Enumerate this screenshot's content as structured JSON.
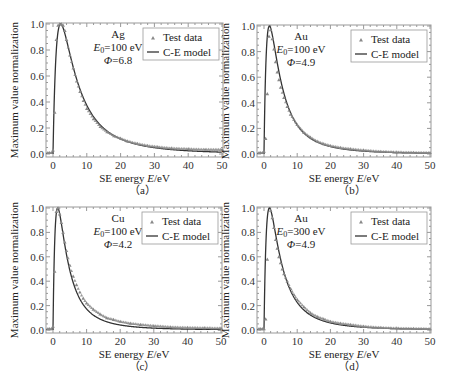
{
  "figure": {
    "width": 453,
    "height": 388,
    "colors": {
      "frame": "#999999",
      "curve": "#333333",
      "marker": "#888888",
      "text": "#222222"
    }
  },
  "chart_data": [
    {
      "id": "a",
      "type": "scatter",
      "caption": "（a）",
      "xlabel": "SE energy E/eV",
      "ylabel": "Maximum value normalization",
      "xlim": [
        -2,
        50
      ],
      "ylim": [
        0,
        1.0
      ],
      "xticks": [
        0,
        10,
        20,
        30,
        40,
        50
      ],
      "yticks": [
        "0.0",
        "0.2",
        "0.4",
        "0.6",
        "0.8",
        "1.0"
      ],
      "annotation": {
        "material": "Ag",
        "E0": "E0=100 eV",
        "phi": "Φ=6.8"
      },
      "legend": [
        "Test data",
        "C-E model"
      ],
      "model": {
        "phi": 6.8,
        "peak_E": 2.2,
        "tail": 0.035
      },
      "series": [
        {
          "name": "Test data",
          "x": [
            -1.5,
            -1,
            -0.5,
            0,
            0.5,
            1,
            1.5,
            2,
            2.5,
            3,
            3.5,
            4,
            5,
            6,
            7,
            8,
            9,
            10,
            12,
            14,
            16,
            18,
            20,
            22,
            25,
            28,
            31,
            35,
            40,
            45,
            50
          ],
          "y": [
            0.01,
            0.01,
            0.01,
            0.03,
            0.32,
            0.88,
            0.99,
            1.0,
            1.0,
            0.99,
            0.95,
            0.88,
            0.76,
            0.66,
            0.56,
            0.48,
            0.41,
            0.35,
            0.27,
            0.21,
            0.17,
            0.14,
            0.12,
            0.1,
            0.08,
            0.065,
            0.055,
            0.045,
            0.04,
            0.035,
            0.035
          ]
        },
        {
          "name": "C-E model",
          "type": "line"
        }
      ]
    },
    {
      "id": "b",
      "type": "scatter",
      "caption": "（b）",
      "xlabel": "SE energy E/eV",
      "ylabel": "Maximum value normalization",
      "xlim": [
        -2,
        50
      ],
      "ylim": [
        0,
        1.0
      ],
      "xticks": [
        0,
        10,
        20,
        30,
        40,
        50
      ],
      "yticks": [
        "0.0",
        "0.2",
        "0.4",
        "0.6",
        "0.8",
        "1.0"
      ],
      "annotation": {
        "material": "Au",
        "E0": "E0=100 eV",
        "phi": "Φ=4.9"
      },
      "legend": [
        "Test data",
        "C-E model"
      ],
      "model": {
        "phi": 4.9,
        "peak_E": 1.6,
        "tail": 0.01
      },
      "series": [
        {
          "name": "Test data",
          "x": [
            -1.5,
            -1,
            -0.5,
            0,
            0.5,
            1,
            1.5,
            2,
            2.5,
            3,
            3.5,
            4,
            4.5,
            5,
            6,
            7,
            8,
            9,
            10,
            12,
            14,
            16,
            18,
            20,
            23,
            26,
            30,
            35,
            40,
            45,
            50
          ],
          "y": [
            0.01,
            0.01,
            0.01,
            0.02,
            0.12,
            0.47,
            0.92,
            0.97,
            0.9,
            0.82,
            0.72,
            0.64,
            0.58,
            0.52,
            0.44,
            0.37,
            0.31,
            0.27,
            0.23,
            0.17,
            0.13,
            0.1,
            0.08,
            0.065,
            0.05,
            0.04,
            0.03,
            0.02,
            0.015,
            0.012,
            0.01
          ]
        },
        {
          "name": "C-E model",
          "type": "line"
        }
      ]
    },
    {
      "id": "c",
      "type": "scatter",
      "caption": "（c）",
      "xlabel": "SE energy E/eV",
      "ylabel": "Maximum value normalization",
      "xlim": [
        -2,
        50
      ],
      "ylim": [
        0,
        1.0
      ],
      "xticks": [
        0,
        10,
        20,
        30,
        40,
        50
      ],
      "yticks": [
        "0.0",
        "0.2",
        "0.4",
        "0.6",
        "0.8",
        "1.0"
      ],
      "annotation": {
        "material": "Cu",
        "E0": "E0=100 eV",
        "phi": "Φ=4.2"
      },
      "legend": [
        "Test data",
        "C-E model"
      ],
      "model": {
        "phi": 4.2,
        "peak_E": 1.4,
        "tail": 0.01
      },
      "series": [
        {
          "name": "Test data",
          "x": [
            -1.5,
            -1,
            -0.5,
            0,
            0.5,
            1,
            1.5,
            2,
            2.5,
            3,
            3.5,
            4,
            5,
            6,
            7,
            8,
            9,
            10,
            12,
            14,
            16,
            18,
            20,
            23,
            26,
            30,
            35,
            40,
            45,
            50
          ],
          "y": [
            0.01,
            0.01,
            0.01,
            0.03,
            0.48,
            0.97,
            1.0,
            0.95,
            0.88,
            0.8,
            0.72,
            0.65,
            0.53,
            0.44,
            0.37,
            0.31,
            0.26,
            0.22,
            0.17,
            0.13,
            0.1,
            0.085,
            0.07,
            0.055,
            0.045,
            0.035,
            0.025,
            0.02,
            0.018,
            0.015
          ]
        },
        {
          "name": "C-E model",
          "type": "line"
        }
      ]
    },
    {
      "id": "d",
      "type": "scatter",
      "caption": "（d）",
      "xlabel": "SE energy E/eV",
      "ylabel": "Maximum value normalization",
      "xlim": [
        -2,
        50
      ],
      "ylim": [
        0,
        1.0
      ],
      "xticks": [
        0,
        10,
        20,
        30,
        40,
        50
      ],
      "yticks": [
        "0.0",
        "0.2",
        "0.4",
        "0.6",
        "0.8",
        "1.0"
      ],
      "annotation": {
        "material": "Au",
        "E0": "E0=300 eV",
        "phi": "Φ=4.9"
      },
      "legend": [
        "Test data",
        "C-E model"
      ],
      "model": {
        "phi": 4.9,
        "peak_E": 1.6,
        "tail": 0.01
      },
      "series": [
        {
          "name": "Test data",
          "x": [
            -1.5,
            -1,
            -0.5,
            0,
            0.5,
            1,
            2,
            2.5,
            3,
            3.5,
            4,
            4.5,
            5,
            5.5,
            6,
            7,
            8,
            9,
            10,
            12,
            14,
            16,
            18,
            20,
            23,
            26,
            30,
            35,
            40,
            45,
            50
          ],
          "y": [
            0.01,
            0.01,
            0.01,
            0.01,
            0.09,
            0.58,
            0.98,
            0.92,
            0.84,
            0.74,
            0.67,
            0.6,
            0.55,
            0.5,
            0.46,
            0.4,
            0.34,
            0.29,
            0.25,
            0.19,
            0.14,
            0.11,
            0.09,
            0.07,
            0.055,
            0.045,
            0.03,
            0.02,
            0.015,
            0.012,
            0.01
          ]
        },
        {
          "name": "C-E model",
          "type": "line"
        }
      ]
    }
  ],
  "panels_layout": [
    {
      "left": 46,
      "top": 23,
      "right": 223,
      "bottom": 157,
      "x0px": 53,
      "x50px": 222,
      "y0px": 154,
      "y1px": 24
    },
    {
      "left": 257,
      "top": 25,
      "right": 431,
      "bottom": 157,
      "x0px": 264,
      "x50px": 430,
      "y0px": 154,
      "y1px": 26
    },
    {
      "left": 46,
      "top": 207,
      "right": 222,
      "bottom": 333,
      "x0px": 53,
      "x50px": 221,
      "y0px": 330,
      "y1px": 208
    },
    {
      "left": 257,
      "top": 207,
      "right": 431,
      "bottom": 333,
      "x0px": 264,
      "x50px": 430,
      "y0px": 330,
      "y1px": 208
    }
  ]
}
